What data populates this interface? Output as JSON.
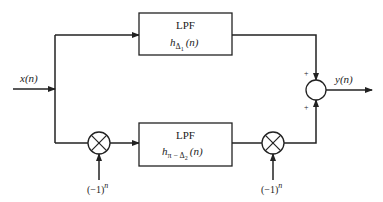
{
  "diagram": {
    "input_label": "x(n)",
    "output_label": "y(n)",
    "top_block": {
      "title": "LPF",
      "func_main": "h",
      "func_sub": "Δ",
      "func_subsub": "1",
      "func_arg": "(n)"
    },
    "bottom_block": {
      "title": "LPF",
      "func_main": "h",
      "func_sub": "π − Δ",
      "func_subsub": "2",
      "func_arg": "(n)"
    },
    "mixer_left_input": "(−1)",
    "mixer_left_exp": "n",
    "mixer_right_input": "(−1)",
    "mixer_right_exp": "n",
    "summer_top_sign": "+",
    "summer_bottom_sign": "+",
    "colors": {
      "stroke": "#222222",
      "background": "#ffffff"
    }
  }
}
